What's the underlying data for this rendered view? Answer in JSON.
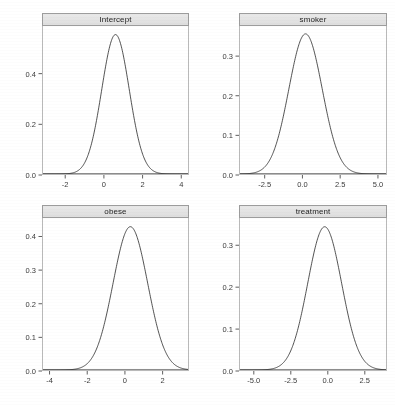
{
  "figure": {
    "kind": "posterior-density-panel-grid",
    "background": "#ffffff",
    "curve_color": "#1a1a1a",
    "axis_color": "#4d4d4d",
    "strip_fill": "#e5e5e5",
    "strip_border": "#9c9c9c",
    "top_artifact_fragments": [
      {
        "text": "",
        "left": 18
      },
      {
        "text": "",
        "left": 74
      },
      {
        "text": "",
        "left": 150
      },
      {
        "text": "",
        "left": 236
      },
      {
        "text": "",
        "left": 318
      }
    ]
  },
  "chart_data": [
    {
      "type": "line",
      "title": "Intercept",
      "xlabel": "",
      "ylabel": "",
      "grid": false,
      "legend": "none",
      "xlim": [
        -3.2,
        4.4
      ],
      "ylim": [
        0,
        0.588
      ],
      "xticks": [
        -2,
        0,
        2,
        4
      ],
      "xticklabels": [
        "-2",
        "0",
        "2",
        "4"
      ],
      "yticks": [
        0.0,
        0.2,
        0.4
      ],
      "yticklabels": [
        "0.0",
        "0.2",
        "0.4"
      ],
      "density": {
        "mean": 0.6,
        "sd": 0.72,
        "peak": 0.554
      },
      "x": [
        -3.2,
        -2.8,
        -2.4,
        -2.0,
        -1.6,
        -1.2,
        -0.8,
        -0.4,
        0.0,
        0.4,
        0.6,
        0.8,
        1.2,
        1.6,
        2.0,
        2.4,
        2.8,
        3.2,
        3.6,
        4.0,
        4.4
      ],
      "y": [
        0.0,
        0.0,
        0.001,
        0.002,
        0.01,
        0.031,
        0.08,
        0.173,
        0.307,
        0.475,
        0.554,
        0.527,
        0.423,
        0.234,
        0.105,
        0.038,
        0.011,
        0.003,
        0.001,
        0.0,
        0.0
      ]
    },
    {
      "type": "line",
      "title": "smoker",
      "xlabel": "",
      "ylabel": "",
      "grid": false,
      "legend": "none",
      "xlim": [
        -4.2,
        5.6
      ],
      "ylim": [
        0,
        0.376
      ],
      "xticks": [
        -2.5,
        0.0,
        2.5,
        5.0
      ],
      "xticklabels": [
        "-2.5",
        "0.0",
        "2.5",
        "5.0"
      ],
      "yticks": [
        0.0,
        0.1,
        0.2,
        0.3
      ],
      "yticklabels": [
        "0.0",
        "0.1",
        "0.2",
        "0.3"
      ],
      "density": {
        "mean": 0.2,
        "sd": 1.12,
        "peak": 0.356
      },
      "x": [
        -4.2,
        -3.6,
        -3.0,
        -2.5,
        -2.0,
        -1.5,
        -1.0,
        -0.5,
        0.0,
        0.2,
        0.5,
        1.0,
        1.5,
        2.0,
        2.5,
        3.0,
        3.6,
        4.2,
        5.0,
        5.6
      ],
      "y": [
        0.0,
        0.001,
        0.005,
        0.013,
        0.031,
        0.063,
        0.114,
        0.18,
        0.245,
        0.356,
        0.34,
        0.274,
        0.192,
        0.119,
        0.065,
        0.031,
        0.01,
        0.002,
        0.0,
        0.0
      ]
    },
    {
      "type": "line",
      "title": "obese",
      "xlabel": "",
      "ylabel": "",
      "grid": false,
      "legend": "none",
      "xlim": [
        -4.4,
        3.4
      ],
      "ylim": [
        0,
        0.455
      ],
      "xticks": [
        -4,
        -2,
        0,
        2
      ],
      "xticklabels": [
        "-4",
        "-2",
        "0",
        "2"
      ],
      "yticks": [
        0.0,
        0.1,
        0.2,
        0.3,
        0.4
      ],
      "yticklabels": [
        "0.0",
        "0.1",
        "0.2",
        "0.3",
        "0.4"
      ],
      "density": {
        "mean": 0.3,
        "sd": 0.93,
        "peak": 0.429
      },
      "x": [
        -4.4,
        -4.0,
        -3.5,
        -3.0,
        -2.5,
        -2.0,
        -1.5,
        -1.0,
        -0.5,
        0.0,
        0.3,
        0.6,
        1.0,
        1.5,
        2.0,
        2.5,
        3.0,
        3.4
      ],
      "y": [
        0.0,
        0.0,
        0.0,
        0.001,
        0.005,
        0.018,
        0.052,
        0.117,
        0.213,
        0.327,
        0.429,
        0.409,
        0.329,
        0.186,
        0.081,
        0.026,
        0.006,
        0.002
      ]
    },
    {
      "type": "line",
      "title": "treatment",
      "xlabel": "",
      "ylabel": "",
      "grid": false,
      "legend": "none",
      "xlim": [
        -6.0,
        4.0
      ],
      "ylim": [
        0,
        0.365
      ],
      "xticks": [
        -5.0,
        -2.5,
        0.0,
        2.5
      ],
      "xticklabels": [
        "-5.0",
        "-2.5",
        "0.0",
        "2.5"
      ],
      "yticks": [
        0.0,
        0.1,
        0.2,
        0.3
      ],
      "yticklabels": [
        "0.0",
        "0.1",
        "0.2",
        "0.3"
      ],
      "density": {
        "mean": -0.2,
        "sd": 1.16,
        "peak": 0.344
      },
      "x": [
        -6.0,
        -5.5,
        -5.0,
        -4.5,
        -4.0,
        -3.5,
        -3.0,
        -2.5,
        -2.0,
        -1.5,
        -1.0,
        -0.5,
        -0.2,
        0.2,
        0.7,
        1.2,
        1.7,
        2.2,
        2.7,
        3.2,
        4.0
      ],
      "y": [
        0.0,
        0.0,
        0.001,
        0.003,
        0.008,
        0.019,
        0.039,
        0.07,
        0.119,
        0.18,
        0.248,
        0.319,
        0.344,
        0.33,
        0.272,
        0.199,
        0.126,
        0.069,
        0.033,
        0.013,
        0.002
      ]
    }
  ]
}
